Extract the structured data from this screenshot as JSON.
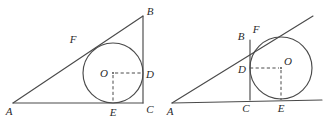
{
  "figure": {
    "background_color": "#ffffff",
    "line_color": "#4a4a4a",
    "label_color": "#2b2b2b"
  },
  "diagrams": [
    {
      "id": "left-diagram",
      "name": "inscribed-circle-right-triangle",
      "description": "Right triangle ABC with the inscribed circle centered at O touching side AC at E, side BC at D, and hypotenuse AB at F.",
      "triangle": {
        "vertices": [
          {
            "label": "A",
            "x": 13,
            "y": 103,
            "label_x": 9,
            "label_y": 114
          },
          {
            "label": "B",
            "x": 143,
            "y": 16,
            "label_x": 147,
            "label_y": 14
          },
          {
            "label": "C",
            "x": 143,
            "y": 103,
            "label_x": 147,
            "label_y": 113
          }
        ],
        "right_angle_at": "C"
      },
      "circle": {
        "center": {
          "label": "O",
          "x": 113,
          "y": 73,
          "label_x": 100,
          "label_y": 77
        },
        "radius": 30
      },
      "tangent_points": [
        {
          "label": "E",
          "x": 113,
          "y": 103,
          "label_x": 109,
          "label_y": 115,
          "touches": "AC"
        },
        {
          "label": "D",
          "x": 143,
          "y": 73,
          "label_x": 147,
          "label_y": 77,
          "touches": "BC"
        },
        {
          "label": "F",
          "x": 88,
          "y": 48,
          "label_x": 70,
          "label_y": 42,
          "touches": "AB"
        }
      ],
      "dashed_segments": [
        {
          "name": "radius-O-to-D",
          "from": "O",
          "to": "D"
        },
        {
          "name": "radius-O-to-E",
          "from": "O",
          "to": "E"
        }
      ]
    },
    {
      "id": "right-diagram",
      "name": "escribed-circle-right-triangle",
      "description": "Right triangle ABC with an escribed circle centered at O tangent to line BC at D, to the extension of AC at E, and to the extension of AB at F.",
      "triangle": {
        "vertices": [
          {
            "label": "A",
            "x": 172,
            "y": 103,
            "label_x": 168,
            "label_y": 114
          },
          {
            "label": "B",
            "x": 250,
            "y": 40,
            "label_x": 238,
            "label_y": 39
          },
          {
            "label": "C",
            "x": 250,
            "y": 100,
            "label_x": 244,
            "label_y": 112
          }
        ],
        "right_angle_at": "C"
      },
      "circle": {
        "center": {
          "label": "O",
          "x": 281,
          "y": 68,
          "label_x": 285,
          "label_y": 65
        },
        "radius": 31
      },
      "tangent_points": [
        {
          "label": "D",
          "x": 250,
          "y": 68,
          "label_x": 238,
          "label_y": 72,
          "touches": "BC"
        },
        {
          "label": "E",
          "x": 281,
          "y": 100,
          "label_x": 277,
          "label_y": 112,
          "touches": "AC extended"
        },
        {
          "label": "F",
          "x": 259,
          "y": 44,
          "label_x": 252,
          "label_y": 31,
          "touches": "AB extended"
        }
      ],
      "dashed_segments": [
        {
          "name": "radius-D-to-O",
          "from": "D",
          "to": "O"
        },
        {
          "name": "radius-O-to-E",
          "from": "O",
          "to": "E"
        }
      ],
      "extended_rays": [
        {
          "name": "ray-AB-extended-beyond-F",
          "to_x": 313,
          "to_y": 16
        },
        {
          "name": "ray-AC-extended-beyond-E",
          "to_x": 322,
          "to_y": 100
        }
      ]
    }
  ]
}
